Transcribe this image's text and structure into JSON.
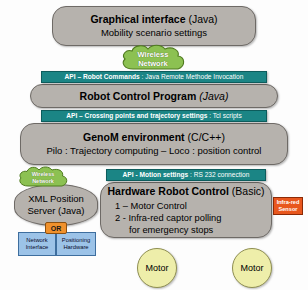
{
  "diagram": {
    "colors": {
      "layer_grey": "#b6b2ad",
      "api_teal": "#1b8585",
      "cloud_green": "#8cc152",
      "or_orange": "#f0912c",
      "blue_box": "#9cc3e8",
      "sensor_orange": "#e8571e",
      "motor_yellow": "#eeeeaa"
    }
  },
  "layers": {
    "gui": {
      "title_bold": "Graphical interface",
      "title_light": "(Java)",
      "subtitle": "Mobility scenario settings"
    },
    "robot_control": {
      "title_bold": "Robot Control Program",
      "title_italic": "(Java)"
    },
    "genom": {
      "title_bold": "GenoM environment",
      "title_light": "(C/C++)",
      "subtitle": "Pilo : Trajectory computing – Loco : position control"
    },
    "hardware": {
      "title_bold": "Hardware Robot Control",
      "title_light": "(Basic)",
      "line1": "1 – Motor Control",
      "line2": "2 -  Infra-red captor polling",
      "line3": "for emergency stops"
    },
    "xml_server": {
      "line1": "XML Position",
      "line2": "Server (Java)"
    }
  },
  "apis": {
    "robot_commands": {
      "bold": "API – Robot Commands",
      "light": " : Java Remote Methode Invocation"
    },
    "trajectory": {
      "bold": "API – Crossing points and trajectory settings",
      "light": " : Tcl scripts"
    },
    "motion": {
      "bold": "API - Motion settings",
      "light": " : RS 232 connection"
    }
  },
  "clouds": {
    "wireless_top": {
      "line1": "Wireless",
      "line2": "Network"
    },
    "wireless_left": {
      "line1": "Wireless",
      "line2": "Network"
    }
  },
  "badges": {
    "or": "OR"
  },
  "subsystems": {
    "network_interface": {
      "line1": "Network",
      "line2": "Interface"
    },
    "positioning_hardware": {
      "line1": "Positioning",
      "line2": "Hardware"
    },
    "infrared_sensor": {
      "line1": "Infra-red",
      "line2": "Sensor"
    }
  },
  "motors": [
    {
      "label": "Motor"
    },
    {
      "label": "Motor"
    }
  ]
}
